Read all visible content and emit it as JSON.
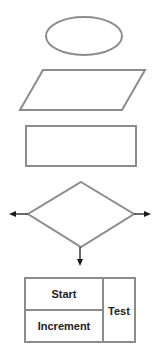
{
  "diagram": {
    "title": "",
    "colors": {
      "stroke": "#8c8c8c",
      "arrow": "#1a1a1a",
      "text": "#222222",
      "background": "#ffffff"
    },
    "shapes": [
      {
        "id": "terminal",
        "type": "ellipse",
        "label": ""
      },
      {
        "id": "input-output",
        "type": "parallelogram",
        "label": ""
      },
      {
        "id": "process",
        "type": "rectangle",
        "label": ""
      },
      {
        "id": "decision",
        "type": "diamond",
        "label": "",
        "arrows": [
          "left",
          "right",
          "down"
        ]
      },
      {
        "id": "loop",
        "type": "loop-box",
        "cells": {
          "start": "Start",
          "increment": "Increment",
          "test": "Test"
        }
      }
    ]
  }
}
